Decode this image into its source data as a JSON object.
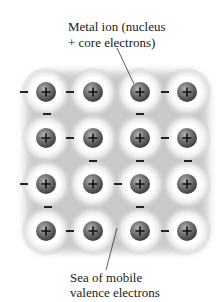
{
  "labels": {
    "top_line1": "Metal ion (nucleus",
    "top_line2": "+ core electrons)",
    "bottom_line1": "Sea of mobile",
    "bottom_line2": "valence electrons"
  },
  "ion_symbol": "+",
  "colors": {
    "sea": "#c9c9c9",
    "halo": "#ffffff",
    "ion_dark": "#4a4a4a",
    "ion_light": "#a8a8a8",
    "text": "#1a1a1a"
  },
  "grid": {
    "columns_x": [
      46,
      93,
      140,
      187
    ],
    "rows_y": [
      92,
      138,
      184,
      231
    ],
    "ion_radius": 10
  },
  "electrons": [
    {
      "x": 24,
      "y": 92
    },
    {
      "x": 70,
      "y": 92
    },
    {
      "x": 165,
      "y": 92
    },
    {
      "x": 47,
      "y": 114
    },
    {
      "x": 140,
      "y": 114
    },
    {
      "x": 70,
      "y": 138
    },
    {
      "x": 165,
      "y": 138
    },
    {
      "x": 93,
      "y": 161
    },
    {
      "x": 140,
      "y": 161
    },
    {
      "x": 188,
      "y": 161
    },
    {
      "x": 24,
      "y": 184
    },
    {
      "x": 118,
      "y": 184
    },
    {
      "x": 48,
      "y": 207
    },
    {
      "x": 140,
      "y": 207
    },
    {
      "x": 70,
      "y": 231
    },
    {
      "x": 165,
      "y": 231
    }
  ]
}
